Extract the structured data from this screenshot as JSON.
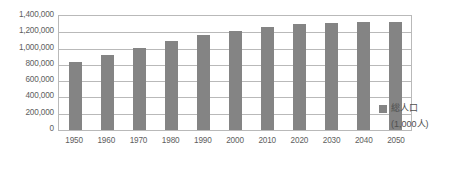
{
  "chart_data": {
    "type": "bar",
    "title": "",
    "subtitle": "",
    "xlabel": "",
    "ylabel": "",
    "categories": [
      "1950",
      "1960",
      "1970",
      "1980",
      "1990",
      "2000",
      "2010",
      "2020",
      "2030",
      "2040",
      "2050"
    ],
    "series": [
      {
        "name": "総人口",
        "unit": "(1,000人)",
        "values": [
          835000,
          925000,
          1010000,
          1090000,
          1165000,
          1210000,
          1262000,
          1298000,
          1318000,
          1322000,
          1328000
        ]
      }
    ],
    "ylim": [
      0,
      1400000
    ],
    "ytick_values": [
      0,
      200000,
      400000,
      600000,
      800000,
      1000000,
      1200000,
      1400000
    ],
    "ytick_labels": [
      "0",
      "200,000",
      "400,000",
      "600,000",
      "800,000",
      "1,000,000",
      "1,200,000",
      "1,400,000"
    ],
    "grid": "horizontal",
    "legend_position": "right",
    "bar_color": "#848484",
    "grid_color": "#b9b9b9",
    "text_color": "#5e5e5e"
  },
  "legend": {
    "series_label": "総人口",
    "unit_label": "(1,000人)",
    "swatch_color": "#848484"
  },
  "axes": {
    "y_labels": [
      "1,400,000",
      "1,200,000",
      "1,000,000",
      "800,000",
      "600,000",
      "400,000",
      "200,000",
      "0"
    ],
    "x_labels": [
      "1950",
      "1960",
      "1970",
      "1980",
      "1990",
      "2000",
      "2010",
      "2020",
      "2030",
      "2040",
      "2050"
    ]
  }
}
